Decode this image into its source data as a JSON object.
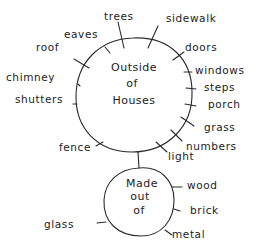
{
  "diagram": {
    "type": "bubble-map",
    "colors": {
      "ink": "#2a2a2a",
      "background": "#ffffff"
    },
    "main_topic": {
      "lines": [
        "Outside",
        "of",
        "Houses"
      ],
      "branches": [
        "trees",
        "sidewalk",
        "doors",
        "windows",
        "steps",
        "porch",
        "grass",
        "numbers",
        "light",
        "fence",
        "shutters",
        "chimney",
        "roof",
        "eaves"
      ]
    },
    "sub_topic": {
      "lines": [
        "Made",
        "out",
        "of"
      ],
      "branches": [
        "wood",
        "brick",
        "metal",
        "glass"
      ]
    }
  }
}
